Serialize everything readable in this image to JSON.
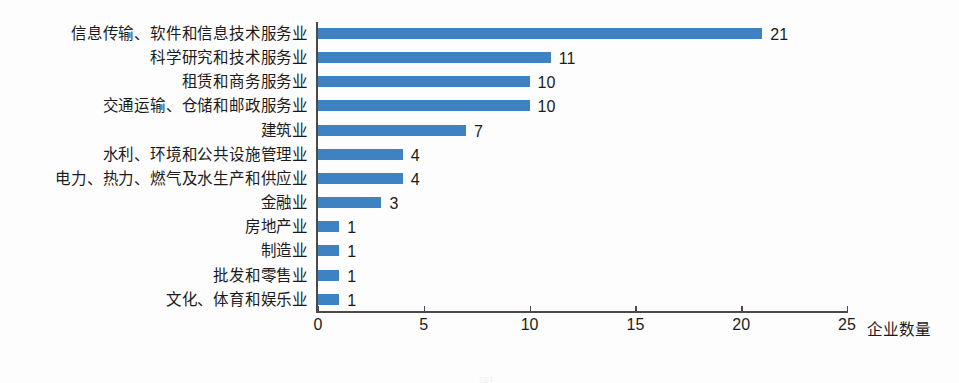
{
  "chart_data": {
    "type": "bar",
    "orientation": "horizontal",
    "title": "",
    "xlabel": "企业数量",
    "ylabel": "",
    "categories": [
      "信息传输、软件和信息技术服务业",
      "科学研究和技术服务业",
      "租赁和商务服务业",
      "交通运输、仓储和邮政服务业",
      "建筑业",
      "水利、环境和公共设施管理业",
      "电力、热力、燃气及水生产和供应业",
      "金融业",
      "房地产业",
      "制造业",
      "批发和零售业",
      "文化、体育和娱乐业"
    ],
    "values": [
      21,
      11,
      10,
      10,
      7,
      4,
      4,
      3,
      1,
      1,
      1,
      1
    ],
    "value_labels": [
      "21",
      "11",
      "10",
      "10",
      "7",
      "4",
      "4",
      "3",
      "1",
      "1",
      "1",
      "1"
    ],
    "xlim": [
      0,
      25
    ],
    "xticks": [
      0,
      5,
      10,
      15,
      20,
      25
    ],
    "xtick_labels": [
      "0",
      "5",
      "10",
      "15",
      "20",
      "25"
    ],
    "grid": false,
    "legend": null,
    "bar_color": "#3d82c2",
    "axis_color": "#4a4a4a",
    "background_color": "#fdfdfd"
  },
  "caption": "图"
}
